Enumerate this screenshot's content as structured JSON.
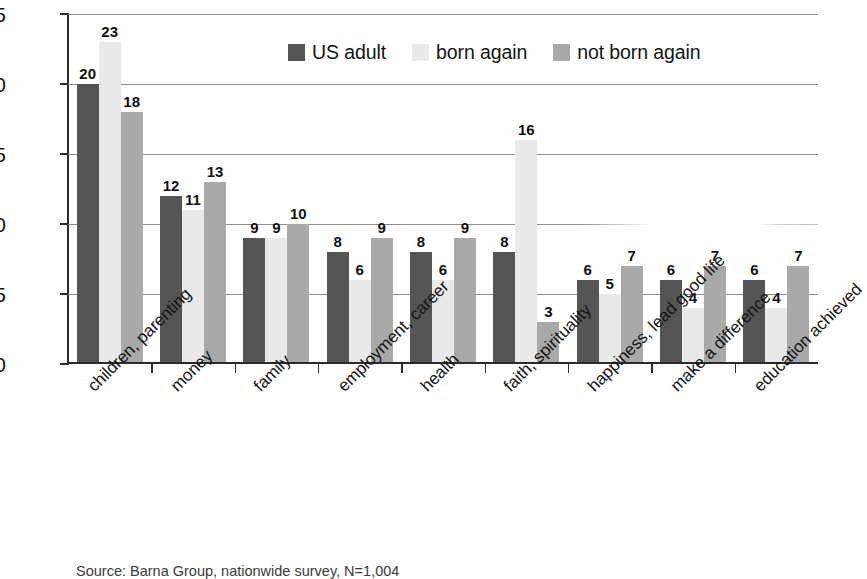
{
  "chart_data": {
    "type": "bar",
    "title": "",
    "subtitle": "",
    "xlabel": "",
    "ylabel": "",
    "ylim": [
      0,
      25
    ],
    "yticks": [
      0,
      5,
      10,
      15,
      20,
      25
    ],
    "grid": true,
    "legend_position": "top-center",
    "categories": [
      "children, parenting",
      "money",
      "family",
      "employment, career",
      "health",
      "faith, spirituality",
      "happiness, lead good life",
      "make a difference",
      "education achieved"
    ],
    "series": [
      {
        "name": "US adult",
        "color": "#555555",
        "values": [
          20,
          12,
          9,
          8,
          8,
          8,
          6,
          6,
          6
        ]
      },
      {
        "name": "born again",
        "color": "#e9e9e9",
        "values": [
          23,
          11,
          9,
          6,
          6,
          16,
          5,
          4,
          4
        ]
      },
      {
        "name": "not born again",
        "color": "#a9a9a9",
        "values": [
          18,
          13,
          10,
          9,
          9,
          3,
          7,
          7,
          7
        ]
      }
    ],
    "source": "Source: Barna Group, nationwide survey, N=1,004"
  },
  "legend": {
    "items": [
      {
        "label": "US adult"
      },
      {
        "label": "born again"
      },
      {
        "label": "not born again"
      }
    ]
  },
  "axis": {
    "y_tick_labels": [
      "25",
      "20",
      "15",
      "10",
      "5",
      "0"
    ]
  },
  "footer": {
    "source": "Source: Barna Group, nationwide survey, N=1,004"
  }
}
